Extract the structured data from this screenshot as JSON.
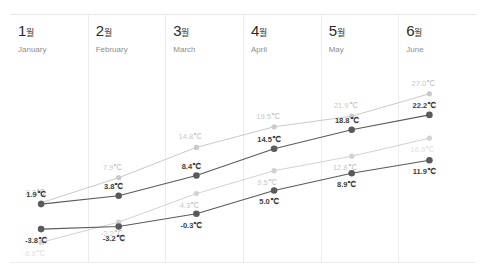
{
  "chart_data": {
    "type": "line",
    "title": "",
    "xlabel": "",
    "ylabel": "",
    "categories": [
      "1월",
      "2월",
      "3월",
      "4월",
      "5월",
      "6월"
    ],
    "category_labels_en": [
      "January",
      "February",
      "March",
      "April",
      "May",
      "June"
    ],
    "unit": "℃",
    "ylim": [
      -9,
      29
    ],
    "grid": "vertical-column-dividers",
    "legend": "none",
    "series": [
      {
        "name": "gray-high",
        "style": "light-gray",
        "color": "#c9c9c9",
        "values": [
          2.2,
          7.9,
          14.8,
          19.5,
          21.9,
          27.0
        ],
        "labels": [
          "2.2℃",
          "7.9℃",
          "14.8℃",
          "19.5℃",
          "21.9℃",
          "27.0℃"
        ]
      },
      {
        "name": "dark-high",
        "style": "dark",
        "color": "#5a5a5a",
        "values": [
          1.9,
          3.8,
          8.4,
          14.5,
          18.8,
          22.2
        ],
        "labels": [
          "1.9℃",
          "3.8℃",
          "8.4℃",
          "14.5℃",
          "18.8℃",
          "22.2℃"
        ]
      },
      {
        "name": "gray-low",
        "style": "light-gray",
        "color": "#d2d2d2",
        "values": [
          -6.8,
          -2.2,
          4.3,
          9.5,
          12.8,
          16.9
        ],
        "labels": [
          "-6.8℃",
          "-2.2℃",
          "4.3℃",
          "9.5℃",
          "12.8℃",
          "16.9℃"
        ]
      },
      {
        "name": "dark-low",
        "style": "dark",
        "color": "#5a5a5a",
        "values": [
          -3.8,
          -3.2,
          -0.3,
          5.0,
          8.9,
          11.9
        ],
        "labels": [
          "-3.8℃",
          "-3.2℃",
          "-0.3℃",
          "5.0℃",
          "8.9℃",
          "11.9℃"
        ]
      }
    ]
  },
  "months": [
    {
      "ko_num": "1",
      "ko_suffix": "월",
      "en": "January"
    },
    {
      "ko_num": "2",
      "ko_suffix": "월",
      "en": "February"
    },
    {
      "ko_num": "3",
      "ko_suffix": "월",
      "en": "March"
    },
    {
      "ko_num": "4",
      "ko_suffix": "월",
      "en": "April"
    },
    {
      "ko_num": "5",
      "ko_suffix": "월",
      "en": "May"
    },
    {
      "ko_num": "6",
      "ko_suffix": "월",
      "en": "June"
    }
  ]
}
